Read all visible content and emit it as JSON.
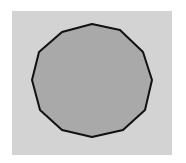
{
  "figure": {
    "background_color": "#ffffff",
    "panel_color": "#d3d3d3",
    "shape": {
      "type": "regular-dodecagon",
      "sides": 12,
      "fill_color": "#a9a9a9",
      "stroke_color": "#111111",
      "stroke_width": 2,
      "points": "92,24 120,30 143,52 152,80 145,110 123,130 92,137 62,130 40,110 32,80 39,52 62,32"
    }
  }
}
